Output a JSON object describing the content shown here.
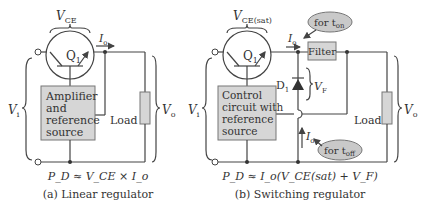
{
  "left": {
    "vce_label": "V",
    "vce_sub": "CE",
    "transistor_label": "Q",
    "transistor_sub": "1",
    "current_label": "I",
    "current_sub": "o",
    "box_lines": [
      "Amplifier",
      "and",
      "reference",
      "source"
    ],
    "load_label": "Load",
    "vin_label": "V",
    "vin_sub": "i",
    "vout_label": "V",
    "vout_sub": "o",
    "formula": "P_D ≈ V_CE × I_o",
    "caption": "(a) Linear regulator"
  },
  "right": {
    "vce_label": "V",
    "vce_sub": "CE(sat)",
    "transistor_label": "Q",
    "transistor_sub": "1",
    "current_label": "I",
    "current_sub": "o",
    "filter_label": "Filter",
    "diode_label": "D",
    "diode_sub": "1",
    "vf_label": "V",
    "vf_sub": "F",
    "bubble_on": "for t",
    "bubble_on_sub": "on",
    "bubble_off": "for t",
    "bubble_off_sub": "off",
    "box_lines": [
      "Control",
      "circuit with",
      "reference",
      "source"
    ],
    "load_label": "Load",
    "vin_label": "V",
    "vin_sub": "i",
    "vout_label": "V",
    "vout_sub": "o",
    "formula": "P_D ≈ I_o(V_CE(sat) + V_F)",
    "caption": "(b) Switching regulator"
  }
}
